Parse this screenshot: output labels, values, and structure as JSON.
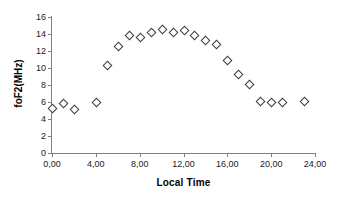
{
  "chart_data": {
    "type": "scatter",
    "title": "",
    "xlabel": "Local Time",
    "ylabel": "foF2(MHz)",
    "xlim": [
      0,
      24
    ],
    "ylim": [
      0,
      16
    ],
    "grid": false,
    "legend": "none",
    "marker": "open-diamond",
    "x_tick_labels": [
      "0,00",
      "4,00",
      "8,00",
      "12,00",
      "16,00",
      "20,00",
      "24,00"
    ],
    "x_tick_values": [
      0,
      4,
      8,
      12,
      16,
      20,
      24
    ],
    "y_tick_labels": [
      "0",
      "2",
      "4",
      "6",
      "8",
      "10",
      "12",
      "14",
      "16"
    ],
    "y_tick_values": [
      0,
      2,
      4,
      6,
      8,
      10,
      12,
      14,
      16
    ],
    "series": [
      {
        "name": "foF2",
        "points": [
          {
            "x": 0,
            "y": 5.3
          },
          {
            "x": 1,
            "y": 5.9
          },
          {
            "x": 2,
            "y": 5.2
          },
          {
            "x": 4,
            "y": 6.0
          },
          {
            "x": 5,
            "y": 10.3
          },
          {
            "x": 6,
            "y": 12.6
          },
          {
            "x": 7,
            "y": 13.9
          },
          {
            "x": 8,
            "y": 13.6
          },
          {
            "x": 9,
            "y": 14.2
          },
          {
            "x": 10,
            "y": 14.6
          },
          {
            "x": 11,
            "y": 14.2
          },
          {
            "x": 12,
            "y": 14.5
          },
          {
            "x": 13,
            "y": 13.9
          },
          {
            "x": 14,
            "y": 13.3
          },
          {
            "x": 15,
            "y": 12.8
          },
          {
            "x": 16,
            "y": 10.9
          },
          {
            "x": 17,
            "y": 9.3
          },
          {
            "x": 18,
            "y": 8.1
          },
          {
            "x": 19,
            "y": 6.1
          },
          {
            "x": 20,
            "y": 6.0
          },
          {
            "x": 21,
            "y": 6.0
          },
          {
            "x": 23,
            "y": 6.1
          }
        ]
      }
    ]
  },
  "colors": {
    "marker_stroke": "#3a3a3a",
    "marker_fill": "#ffffff",
    "axis": "#808080",
    "text": "#000000",
    "background": "#ffffff"
  }
}
